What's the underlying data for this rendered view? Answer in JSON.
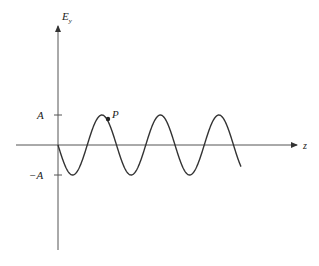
{
  "diagram": {
    "type": "sine-wave-plot",
    "y_axis_label": "E",
    "y_axis_subscript": "y",
    "x_axis_label": "z",
    "tick_labels": {
      "positive": "A",
      "negative": "−A"
    },
    "point_label": "P",
    "colors": {
      "axis": "#333333",
      "wave": "#333333",
      "text": "#222222"
    }
  }
}
